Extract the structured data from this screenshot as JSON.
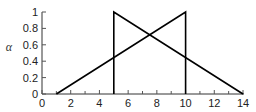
{
  "chart_data": {
    "type": "line",
    "title": "",
    "xlabel": "",
    "ylabel": "α",
    "xlim": [
      0,
      14
    ],
    "ylim": [
      0,
      1
    ],
    "grid": false,
    "legend": null,
    "x_ticks": [
      0,
      2,
      4,
      6,
      8,
      10,
      12,
      14
    ],
    "x_tick_labels": [
      "0",
      "2",
      "4",
      "6",
      "8",
      "10",
      "12",
      "14"
    ],
    "y_ticks": [
      0,
      0.2,
      0.4,
      0.6,
      0.8,
      1
    ],
    "y_tick_labels": [
      "0",
      "0.2",
      "0.4",
      "0.6",
      "0.8",
      "1"
    ],
    "series": [
      {
        "name": "rising-membership",
        "points": [
          [
            1,
            0
          ],
          [
            10,
            1
          ],
          [
            10,
            0
          ]
        ],
        "color": "#000000"
      },
      {
        "name": "falling-membership",
        "points": [
          [
            5,
            0
          ],
          [
            5,
            1
          ],
          [
            14,
            0
          ]
        ],
        "color": "#000000"
      }
    ],
    "annotations": [
      {
        "type": "intersection",
        "x": 7.5,
        "y": 0.72
      }
    ]
  }
}
